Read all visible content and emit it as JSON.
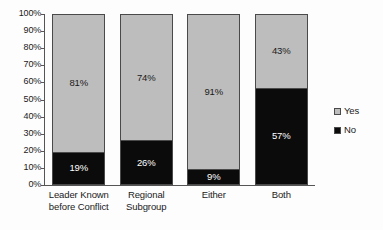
{
  "chart_data": {
    "type": "bar",
    "subtype": "stacked-100-percent",
    "title": "",
    "subtitle": "",
    "xlabel": "",
    "ylabel": "",
    "ylim": [
      0,
      100
    ],
    "grid": false,
    "legend_position": "right",
    "categories": [
      "Leader Known before Conflict",
      "Regional Subgroup",
      "Either",
      "Both"
    ],
    "category_lines": [
      [
        "Leader Known",
        "before Conflict"
      ],
      [
        "Regional",
        "Subgroup"
      ],
      [
        "Either",
        ""
      ],
      [
        "Both",
        ""
      ]
    ],
    "series": [
      {
        "name": "Yes",
        "color": "#bdbdbd",
        "values": [
          81,
          74,
          91,
          43
        ],
        "labels": [
          "81%",
          "74%",
          "91%",
          "43%"
        ]
      },
      {
        "name": "No",
        "color": "#0b0b0b",
        "values": [
          19,
          26,
          9,
          57
        ],
        "labels": [
          "19%",
          "26%",
          "9%",
          "57%"
        ]
      }
    ],
    "y_ticks": [
      100,
      90,
      80,
      70,
      60,
      50,
      40,
      30,
      20,
      10,
      0
    ],
    "y_tick_labels": [
      "100%",
      "90%",
      "80%",
      "70%",
      "60%",
      "50%",
      "40%",
      "30%",
      "20%",
      "10%",
      "0%"
    ]
  },
  "legend": {
    "items": [
      {
        "label": "Yes",
        "color": "#bdbdbd"
      },
      {
        "label": "No",
        "color": "#0b0b0b"
      }
    ]
  },
  "colors": {
    "yes": "#bdbdbd",
    "no": "#0b0b0b",
    "axis": "#555555",
    "text": "#1a1a1a",
    "background": "#fdfdfd"
  }
}
